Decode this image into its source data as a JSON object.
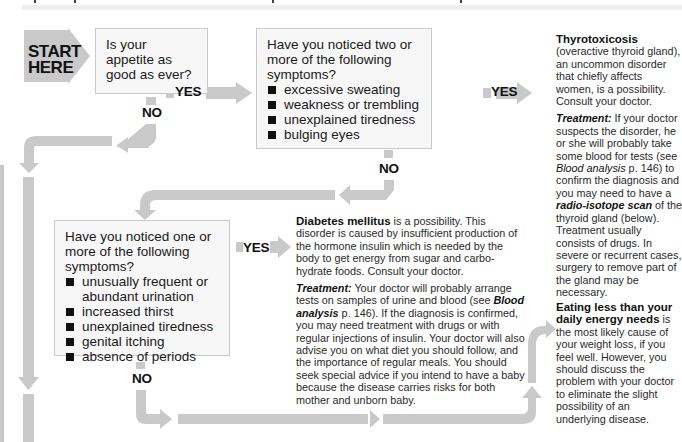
{
  "colors": {
    "arrow_gray": "#c9c9c9",
    "box_fill": "#f7f7f7",
    "box_border": "#c9c9c9",
    "text": "#222222"
  },
  "start": {
    "line1": "START",
    "line2": "HERE"
  },
  "question1": {
    "text": "Is your appetite as good as ever?"
  },
  "question2": {
    "text": "Have you noticed two or more of the following symptoms?",
    "items": [
      "excessive sweating",
      "weakness or trembling",
      "unexplained tiredness",
      "bulging eyes"
    ]
  },
  "question3": {
    "text": "Have you noticed one or more of the following symptoms?",
    "items": [
      "unusually frequent or abundant urination",
      "increased thirst",
      "unexplained tiredness",
      "genital itching",
      "absence of periods"
    ]
  },
  "labels": {
    "yes": "YES",
    "no": "NO"
  },
  "thyrotoxicosis": {
    "title": "Thyrotoxicosis",
    "intro": "(overactive thyroid gland), an uncommon disorder that chiefly affects women, is a possibility. Consult your doctor.",
    "treatment_label": "Treatment:",
    "treatment_1": " If your doctor suspects the disorder, he or she will probably take some blood for tests (see ",
    "link_blood": "Blood analysis",
    "treatment_2": " p. 146) to confirm the diagnosis and you may need to have a ",
    "link_scan": "radio-isotope scan",
    "treatment_3": " of the thyroid gland (below). Treatment usually consists of drugs. In severe or recurrent cases, surgery to remove part of the gland may be necessary."
  },
  "diabetes": {
    "title": "Diabetes mellitus",
    "intro": " is a possibility. This disorder is caused by insufficient production of the hormone insulin which is needed by the body to get energy from sugar and carbo-hydrate foods. Consult your doctor.",
    "treatment_label": "Treatment:",
    "treatment_1": " Your doctor will probably arrange tests on samples of urine and blood (see ",
    "link_blood": "Blood analysis",
    "treatment_2": " p. 146). If the diagnosis is confirmed, you may need treatment with drugs or with regular injections of insulin. Your doctor will also advise you on what diet you should follow, and the importance of regular meals. You should seek special advice if you intend to have a baby because the disease carries risks for both mother and unborn baby."
  },
  "eating_less": {
    "title": "Eating less than your daily energy needs",
    "body": " is the most likely cause of your weight loss, if you feel well. However, you should discuss the problem with your doctor to eliminate the slight possibility of an underlying disease."
  }
}
